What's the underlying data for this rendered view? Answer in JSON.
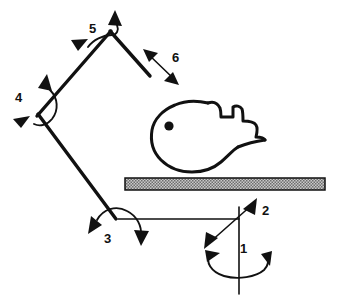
{
  "figure": {
    "stroke_color": "#111111",
    "background_color": "#ffffff",
    "table_fill_color": "#b8b8b8"
  },
  "axis_labels": [
    {
      "id": "1",
      "text": "1",
      "x": 240,
      "y": 253,
      "description": "base vertical rotation axis"
    },
    {
      "id": "2",
      "text": "2",
      "x": 262,
      "y": 215,
      "description": "shoulder translation / tilt double arrow"
    },
    {
      "id": "3",
      "text": "3",
      "x": 107,
      "y": 238,
      "description": "elbow joint rotation"
    },
    {
      "id": "4",
      "text": "4",
      "x": 19,
      "y": 101,
      "description": "lower arm joint rotation"
    },
    {
      "id": "5",
      "text": "5",
      "x": 93,
      "y": 32,
      "description": "wrist joint rotation"
    },
    {
      "id": "6",
      "text": "6",
      "x": 172,
      "y": 60,
      "description": "gripper axial double arrow"
    }
  ],
  "elements": {
    "table": {
      "name": "table-surface",
      "x": 125,
      "y": 178,
      "width": 200,
      "height": 12,
      "fill": "#b8b8b8",
      "pattern": "hatched"
    },
    "hand": {
      "name": "hand-silhouette",
      "eye_dot": {
        "x": 169,
        "y": 126,
        "r": 4.6
      }
    },
    "base_axis": {
      "name": "base-vertical-axis",
      "x": 239,
      "y_top": 210,
      "y_bottom": 295
    },
    "base_ellipse": {
      "name": "base-rotation-ellipse",
      "cx": 239,
      "cy": 262,
      "rx": 32,
      "ry": 13
    },
    "links": [
      {
        "name": "link-base-to-elbow",
        "x1": 239,
        "y1": 219,
        "x2": 118,
        "y2": 219
      },
      {
        "name": "link-elbow-to-lower",
        "x1": 115,
        "y1": 218,
        "x2": 38,
        "y2": 114
      },
      {
        "name": "link-lower-to-wrist",
        "x1": 37,
        "y1": 116,
        "x2": 110,
        "y2": 31
      },
      {
        "name": "link-wrist-to-gripper",
        "x1": 110,
        "y1": 31,
        "x2": 150,
        "y2": 75
      }
    ]
  }
}
